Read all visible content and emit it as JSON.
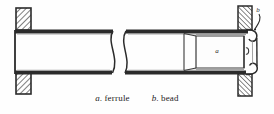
{
  "figure": {
    "background_color": "#fefefe",
    "ink_color": "#2b2b2b",
    "width": 274,
    "height": 114
  },
  "labels": {
    "ferrule_callout": "a",
    "bead_callout": "b"
  },
  "caption": {
    "items": [
      {
        "key": "a.",
        "word": "ferrule"
      },
      {
        "key": "b.",
        "word": "bead"
      }
    ]
  },
  "parts": {
    "tube": "tube-body",
    "break_symbol": "break-lines",
    "tubesheet_left_top": "tube-sheet-hatched-block",
    "tubesheet_left_bottom": "tube-sheet-hatched-block",
    "tubesheet_right_top": "tube-sheet-hatched-block",
    "tubesheet_right_bottom": "tube-sheet-hatched-block",
    "ferrule": "inner-ferrule-sleeve",
    "bead": "rolled-bead-lip"
  }
}
